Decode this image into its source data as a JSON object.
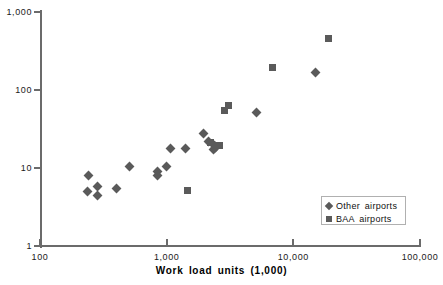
{
  "chart_data": {
    "type": "scatter",
    "title": "",
    "xlabel": "Work  load  units  (1,000)",
    "ylabel": "",
    "xscale": "log",
    "yscale": "log",
    "xlim": [
      100,
      100000
    ],
    "ylim": [
      1,
      1000
    ],
    "grid": false,
    "xticks": [
      "100",
      "1,000",
      "10,000",
      "100,000"
    ],
    "xtick_values": [
      100,
      1000,
      10000,
      100000
    ],
    "yticks": [
      "1",
      "10",
      "100",
      "1,000"
    ],
    "ytick_values": [
      1,
      10,
      100,
      1000
    ],
    "legend_position": "lower-right",
    "marker_color": "#5a5a5a",
    "axis_color": "#6b6b6b",
    "series": [
      {
        "name": "Other  airports",
        "marker": "diamond",
        "points": [
          {
            "x": 240,
            "y": 8.1
          },
          {
            "x": 238,
            "y": 5.0
          },
          {
            "x": 282,
            "y": 5.8
          },
          {
            "x": 287,
            "y": 4.4
          },
          {
            "x": 400,
            "y": 5.5
          },
          {
            "x": 510,
            "y": 10.6
          },
          {
            "x": 840,
            "y": 8.9
          },
          {
            "x": 845,
            "y": 7.9
          },
          {
            "x": 1000,
            "y": 10.5
          },
          {
            "x": 1070,
            "y": 18.0
          },
          {
            "x": 1420,
            "y": 18.0
          },
          {
            "x": 1950,
            "y": 27.5
          },
          {
            "x": 2150,
            "y": 22.0
          },
          {
            "x": 2330,
            "y": 17.5
          },
          {
            "x": 2400,
            "y": 19.5
          },
          {
            "x": 2450,
            "y": 18.5
          },
          {
            "x": 5100,
            "y": 52.0
          },
          {
            "x": 15000,
            "y": 170.0
          }
        ]
      },
      {
        "name": "BAA  airports",
        "marker": "square",
        "points": [
          {
            "x": 1470,
            "y": 5.2
          },
          {
            "x": 2230,
            "y": 21.5
          },
          {
            "x": 2600,
            "y": 19.5
          },
          {
            "x": 2850,
            "y": 54.0
          },
          {
            "x": 3050,
            "y": 63.0
          },
          {
            "x": 6900,
            "y": 195.0
          },
          {
            "x": 19000,
            "y": 455.0
          }
        ]
      }
    ]
  },
  "legend": {
    "entries": [
      {
        "label": "Other  airports",
        "marker": "diamond"
      },
      {
        "label": "BAA  airports",
        "marker": "square"
      }
    ]
  },
  "top_crumb": ""
}
